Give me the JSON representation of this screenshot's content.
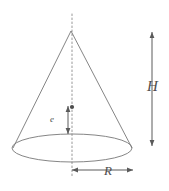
{
  "figure": {
    "name": "cone-geometry-diagram",
    "shape": "cone",
    "stroke_color": "#808080",
    "label_color": "#4d4d4d",
    "background_color": "#ffffff",
    "labels": {
      "height": "H",
      "radius": "R",
      "inner": "e"
    },
    "geometry": {
      "apex_x": 71,
      "apex_y": 31,
      "base_center_x": 72,
      "base_center_y": 148,
      "base_radius_x": 60,
      "base_radius_y": 14,
      "axis_top_y": 14,
      "axis_bottom_y": 178
    },
    "dimensions": {
      "height_arrow_x": 152,
      "height_arrow_top_y": 32,
      "height_arrow_bottom_y": 146,
      "radius_arrow_y": 170,
      "radius_arrow_left_x": 72,
      "radius_arrow_right_x": 133,
      "inner_arrow_x": 68,
      "inner_arrow_top_y": 106,
      "inner_arrow_bottom_y": 134,
      "axis_dot_x": 72,
      "axis_dot_y": 107
    }
  }
}
